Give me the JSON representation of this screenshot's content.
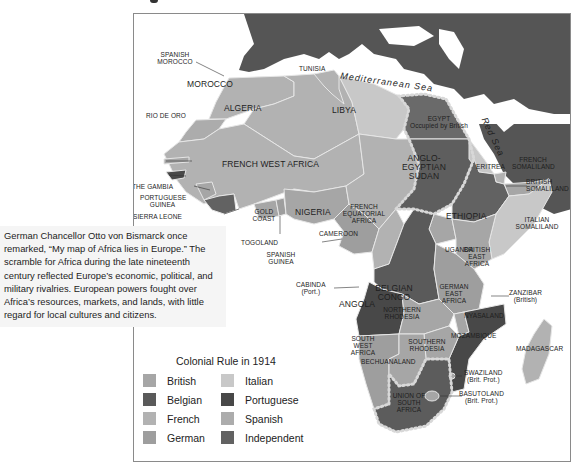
{
  "colors": {
    "british": "#a6a6a6",
    "belgian": "#5a5a5a",
    "french": "#b2b2b2",
    "german": "#9e9e9e",
    "italian": "#c8c8c8",
    "portuguese": "#484848",
    "spanish": "#acacac",
    "independent": "#626262",
    "europe_asia": "#555555",
    "sea": "#ffffff",
    "border": "#e6e6e6"
  },
  "caption": {
    "text": "German Chancellor Otto von Bismarck once remarked, “My map of Africa lies in Europe.” The scramble for Africa during the late nineteenth century reflected Europe’s economic, political, and military rivalries. European powers fought over Africa’s resources, markets, and lands, with little regard for local cultures and citizens."
  },
  "seas": {
    "mediterranean": "Mediterranean Sea",
    "red": "Red Sea"
  },
  "regions": {
    "spanish_morocco": "Spanish Morocco",
    "tunisia": "Tunisia",
    "morocco": "Morocco",
    "algeria": "Algeria",
    "libya": "Libya",
    "rio_de_oro": "Rio de Oro",
    "egypt": "Egypt",
    "egypt_note": "Occupied by British",
    "french_west_africa": "French West Africa",
    "anglo_egyptian_sudan": "Anglo-Egyptian Sudan",
    "eritrea": "Eritrea",
    "french_somaliland": "French Somaliland",
    "british_somaliland": "British Somaliland",
    "the_gambia": "The Gambia",
    "portuguese_guinea": "Portuguese Guinea",
    "sierra_leone": "Sierra Leone",
    "liberia": "Liberia",
    "gold_coast": "Gold Coast",
    "togoland": "Togoland",
    "nigeria": "Nigeria",
    "cameroon": "Cameroon",
    "french_equatorial_africa": "French Equatorial Africa",
    "ethiopia": "Ethiopia",
    "italian_somaliland": "Italian Somaliland",
    "spanish_guinea": "Spanish Guinea",
    "uganda": "Uganda",
    "british_east_africa": "British East Africa",
    "belgian_congo": "Belgian Congo",
    "cabinda": "Cabinda",
    "cabinda_note": "(Port.)",
    "german_east_africa": "German East Africa",
    "zanzibar": "Zanzibar",
    "zanzibar_note": "(British)",
    "angola": "Angola",
    "northern_rhodesia": "Northern Rhodesia",
    "nyasaland": "Nyasaland",
    "mozambique": "Mozambique",
    "madagascar": "Madagascar",
    "south_west_africa": "South West Africa",
    "southern_rhodesia": "Southern Rhodesia",
    "bechuanaland": "Bechuanaland",
    "swaziland": "Swaziland",
    "swaziland_note": "(Brit. Prot.)",
    "basutoland": "Basutoland",
    "basutoland_note": "(Brit. Prot.)",
    "union_of_south_africa": "Union of South Africa"
  },
  "legend": {
    "title": "Colonial Rule in 1914",
    "items": [
      {
        "label": "British",
        "color": "#a6a6a6"
      },
      {
        "label": "Italian",
        "color": "#c8c8c8"
      },
      {
        "label": "Belgian",
        "color": "#5a5a5a"
      },
      {
        "label": "Portuguese",
        "color": "#484848"
      },
      {
        "label": "French",
        "color": "#b2b2b2"
      },
      {
        "label": "Spanish",
        "color": "#acacac"
      },
      {
        "label": "German",
        "color": "#9e9e9e"
      },
      {
        "label": "Independent",
        "color": "#626262"
      }
    ]
  }
}
